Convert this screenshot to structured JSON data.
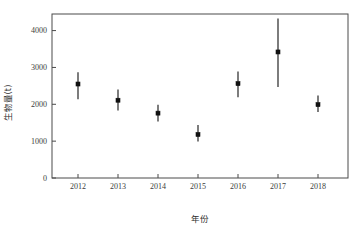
{
  "chart_data": {
    "type": "scatter",
    "title": "",
    "subtitle": "",
    "xlabel": "年份",
    "ylabel": "生物量(t)",
    "x": [
      2012,
      2013,
      2014,
      2015,
      2016,
      2017,
      2018
    ],
    "categories": [
      "2012",
      "2013",
      "2014",
      "2015",
      "2016",
      "2017",
      "2018"
    ],
    "values": [
      2550,
      2110,
      1760,
      1180,
      2560,
      3420,
      1990
    ],
    "error_low": [
      2140,
      1830,
      1530,
      990,
      2190,
      2470,
      1790
    ],
    "error_high": [
      2870,
      2400,
      1990,
      1440,
      2890,
      4330,
      2240
    ],
    "series": [
      {
        "name": "生物量(t)",
        "values": [
          2550,
          2110,
          1760,
          1180,
          2560,
          3420,
          1990
        ],
        "error_low": [
          2140,
          1830,
          1530,
          990,
          2190,
          2470,
          1790
        ],
        "error_high": [
          2870,
          2400,
          1990,
          1440,
          2890,
          4330,
          2240
        ]
      }
    ],
    "points": [
      {
        "x": "2012",
        "mean": 2550,
        "low": 2140,
        "high": 2870
      },
      {
        "x": "2013",
        "mean": 2110,
        "low": 1830,
        "high": 2400
      },
      {
        "x": "2014",
        "mean": 1760,
        "low": 1530,
        "high": 1990
      },
      {
        "x": "2015",
        "mean": 1180,
        "low": 990,
        "high": 1440
      },
      {
        "x": "2016",
        "mean": 2560,
        "low": 2190,
        "high": 2890
      },
      {
        "x": "2017",
        "mean": 3420,
        "low": 2470,
        "high": 4330
      },
      {
        "x": "2018",
        "mean": 1990,
        "low": 1790,
        "high": 2240
      }
    ],
    "ylim": [
      0,
      4450
    ],
    "xlim": [
      2011.35,
      2018.75
    ],
    "yticks": [
      0,
      1000,
      2000,
      3000,
      4000
    ],
    "ytick_labels": [
      "0",
      "1000",
      "2000",
      "3000",
      "4000"
    ],
    "xticks": [
      2012,
      2013,
      2014,
      2015,
      2016,
      2017,
      2018
    ],
    "xtick_labels": [
      "2012",
      "2013",
      "2014",
      "2015",
      "2016",
      "2017",
      "2018"
    ],
    "grid": false,
    "legend": false,
    "legend_position": "none",
    "marker": "filled-square",
    "marker_color": "#111111",
    "error_bar_color": "#111111",
    "frame": "box",
    "tick_direction": "in",
    "background_color": "#ffffff",
    "axis_color": "#4a4a4a"
  }
}
